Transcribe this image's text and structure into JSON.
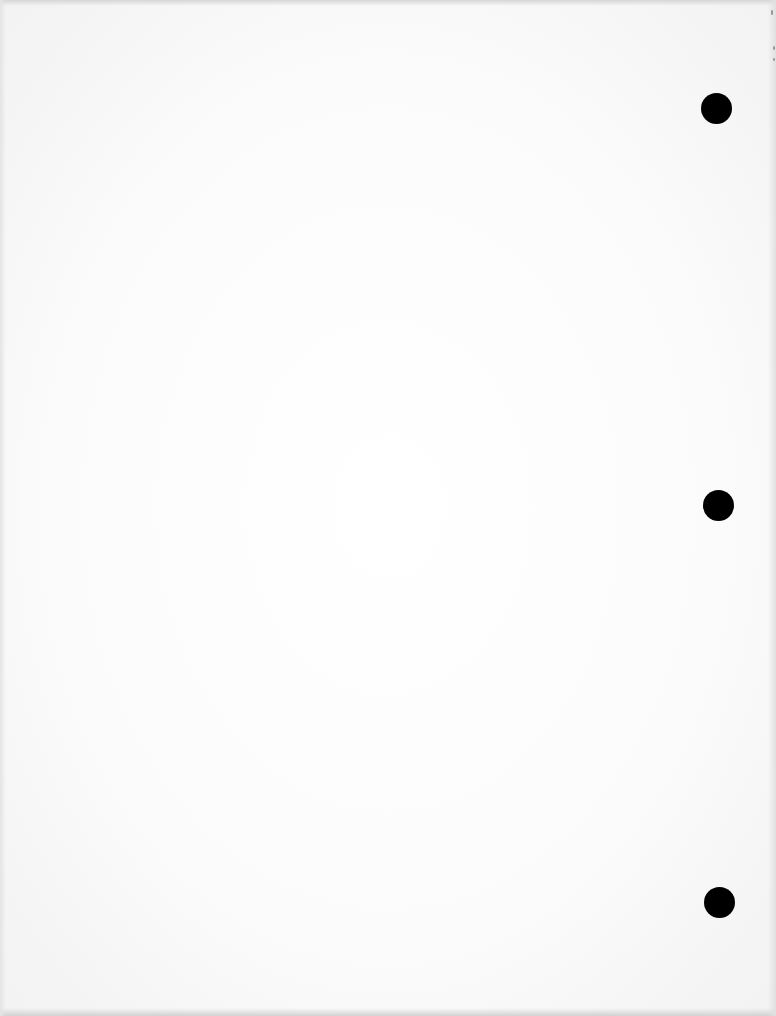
{
  "document": {
    "type": "blank scanned page",
    "text": "",
    "hole_punches": [
      {
        "name": "top",
        "x": 716,
        "y": 108
      },
      {
        "name": "middle",
        "x": 718,
        "y": 505
      },
      {
        "name": "bottom",
        "x": 719,
        "y": 902
      }
    ],
    "colors": {
      "paper": "#ffffff",
      "hole": "#000000",
      "edge_shadow": "#d4d4d4"
    }
  }
}
